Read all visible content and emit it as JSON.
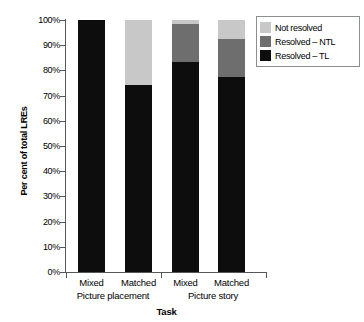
{
  "chart_data": {
    "type": "bar",
    "stacked": true,
    "title": "",
    "xlabel": "Task",
    "ylabel": "Per cent of total LREs",
    "ylim": [
      0,
      100
    ],
    "ytick_labels": [
      "100%",
      "90%",
      "80%",
      "70%",
      "60%",
      "50%",
      "40%",
      "30%",
      "20%",
      "10%",
      "0%"
    ],
    "ytick_values": [
      100,
      90,
      80,
      70,
      60,
      50,
      40,
      30,
      20,
      10,
      0
    ],
    "grid": false,
    "legend_position": "top-right",
    "categories": [
      "Mixed",
      "Matched",
      "Mixed",
      "Matched"
    ],
    "groups": [
      {
        "label": "Picture placement",
        "categories": [
          "Mixed",
          "Matched"
        ]
      },
      {
        "label": "Picture story",
        "categories": [
          "Mixed",
          "Matched"
        ]
      }
    ],
    "series": [
      {
        "name": "Resolved – TL",
        "color": "#0d0d0d",
        "values": [
          100.0,
          74.2,
          83.3,
          77.4
        ]
      },
      {
        "name": "Resolved – NTL",
        "color": "#6e6e6e",
        "values": [
          0.0,
          0.0,
          15.0,
          15.1
        ]
      },
      {
        "name": "Not resolved",
        "color": "#c8c8c8",
        "values": [
          0.0,
          25.8,
          1.7,
          7.5
        ]
      }
    ],
    "legend_entries": [
      {
        "label": "Not resolved",
        "color": "#c8c8c8"
      },
      {
        "label": "Resolved – NTL",
        "color": "#6e6e6e"
      },
      {
        "label": "Resolved – TL",
        "color": "#0d0d0d"
      }
    ]
  }
}
